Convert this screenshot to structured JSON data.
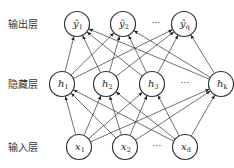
{
  "layers": {
    "output": {
      "label": "输出层",
      "nodes": [
        {
          "base": "ŷ",
          "sub": "1",
          "cx": 77,
          "cy": 24
        },
        {
          "base": "ŷ",
          "sub": "2",
          "cx": 123,
          "cy": 24
        },
        {
          "base": "ŷ",
          "sub": "q",
          "cx": 184,
          "cy": 24
        }
      ],
      "ellipsis": {
        "text": "···",
        "x": 156,
        "y": 24
      }
    },
    "hidden": {
      "label": "隐藏层",
      "nodes": [
        {
          "base": "h",
          "sub": "1",
          "cx": 62,
          "cy": 84
        },
        {
          "base": "h",
          "sub": "2",
          "cx": 106,
          "cy": 84
        },
        {
          "base": "h",
          "sub": "3",
          "cx": 152,
          "cy": 84
        },
        {
          "base": "h",
          "sub": "k",
          "cx": 221,
          "cy": 84
        }
      ],
      "ellipsis": {
        "text": "···",
        "x": 185,
        "y": 84
      }
    },
    "input": {
      "label": "输入层",
      "nodes": [
        {
          "base": "x",
          "sub": "1",
          "cx": 79,
          "cy": 147
        },
        {
          "base": "x",
          "sub": "2",
          "cx": 125,
          "cy": 147
        },
        {
          "base": "x",
          "sub": "d",
          "cx": 185,
          "cy": 147
        }
      ],
      "ellipsis": {
        "text": "···",
        "x": 157,
        "y": 147
      }
    }
  },
  "node_radius": 12.5,
  "stroke_color": "#333333"
}
